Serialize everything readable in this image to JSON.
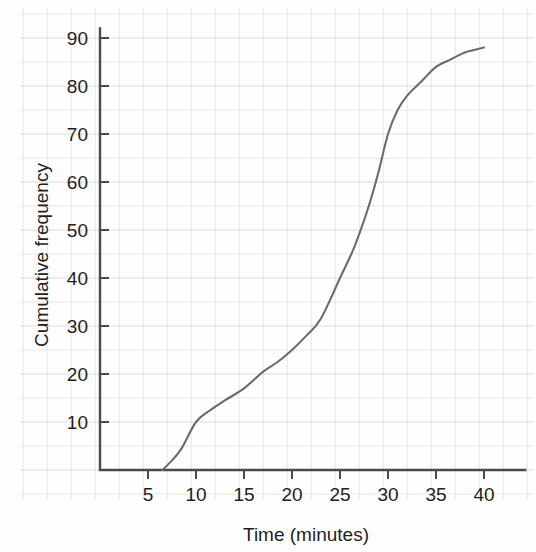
{
  "chart_data": {
    "type": "line",
    "title": "",
    "subtitle": "",
    "xlabel": "Time (minutes)",
    "ylabel": "Cumulative frequency",
    "xlim": [
      0,
      42
    ],
    "ylim": [
      0,
      92
    ],
    "x_ticks": [
      5,
      10,
      15,
      20,
      25,
      30,
      35,
      40
    ],
    "x_tick_labels": [
      "5",
      "10",
      "15",
      "20",
      "25",
      "30",
      "35",
      "40"
    ],
    "y_ticks": [
      10,
      20,
      30,
      40,
      50,
      60,
      70,
      80,
      90
    ],
    "y_tick_labels": [
      "10",
      "20",
      "30",
      "40",
      "50",
      "60",
      "70",
      "80",
      "90"
    ],
    "grid": true,
    "grid_major_step_x": 5,
    "grid_major_step_y": 10,
    "grid_minor_step_x": 2.5,
    "grid_minor_step_y": 5,
    "legend": null,
    "legend_position": "none",
    "annotations": [],
    "series": [
      {
        "name": "Cumulative frequency",
        "color": "#6b6b6b",
        "x": [
          6.5,
          7.5,
          8.5,
          10,
          11.5,
          13,
          15,
          17,
          18.5,
          20,
          21.5,
          23,
          25,
          26.5,
          28,
          29,
          30,
          31,
          32,
          33.5,
          35,
          36.5,
          38,
          40
        ],
        "values": [
          0,
          2,
          4.5,
          10,
          12.5,
          14.5,
          17,
          20.5,
          22.5,
          25,
          28,
          31.5,
          40,
          46.5,
          55,
          62,
          70,
          75,
          78,
          81,
          84,
          85.5,
          87,
          88
        ]
      }
    ]
  },
  "axes": {
    "y_axis_label": "Cumulative frequency",
    "x_axis_label": "Time (minutes)"
  },
  "colors": {
    "curve": "#6b6b6b",
    "axis": "#4a4a4a",
    "grid_major": "#dcdcdc",
    "grid_minor": "#e6e6e6",
    "text": "#231f20",
    "background": "#fefefe"
  }
}
